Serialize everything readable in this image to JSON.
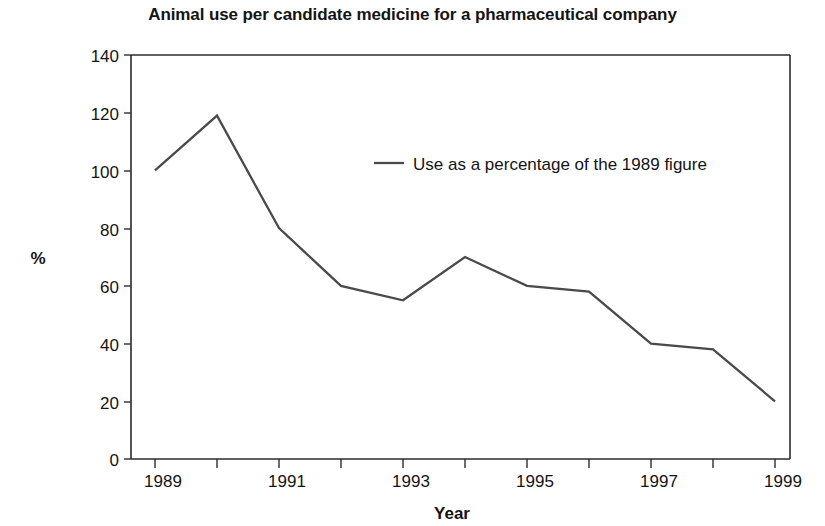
{
  "chart_data": {
    "type": "line",
    "title": "Animal use per candidate medicine for a pharmaceutical company",
    "xlabel": "Year",
    "ylabel": "%",
    "x": [
      1989,
      1990,
      1991,
      1992,
      1993,
      1994,
      1995,
      1996,
      1997,
      1998,
      1999
    ],
    "categories": [
      "1989",
      "1990",
      "1991",
      "1992",
      "1993",
      "1994",
      "1995",
      "1996",
      "1997",
      "1998",
      "1999"
    ],
    "values": [
      100,
      119,
      80,
      60,
      55,
      70,
      60,
      58,
      40,
      38,
      20
    ],
    "series": [
      {
        "name": "Use as a percentage of the 1989 figure",
        "values": [
          100,
          119,
          80,
          60,
          55,
          70,
          60,
          58,
          40,
          38,
          20
        ],
        "color": "#4a4a4a"
      }
    ],
    "xlim": [
      1989,
      1999
    ],
    "ylim": [
      0,
      140
    ],
    "y_ticks": [
      0,
      20,
      40,
      60,
      80,
      100,
      120,
      140
    ],
    "y_tick_labels": [
      "0",
      "20",
      "40",
      "60",
      "80",
      "100",
      "120",
      "140"
    ],
    "x_ticks": [
      1989,
      1990,
      1991,
      1992,
      1993,
      1994,
      1995,
      1996,
      1997,
      1998,
      1999
    ],
    "x_tick_labels": [
      "1989",
      "",
      "1991",
      "",
      "1993",
      "",
      "1995",
      "",
      "1997",
      "",
      "1999"
    ],
    "x_labeled_ticks": [
      "1989",
      "1991",
      "1993",
      "1995",
      "1997",
      "1999"
    ],
    "grid": false,
    "legend": {
      "position": "inside-upper-right",
      "entries": [
        {
          "label": "Use as a percentage of the 1989 figure",
          "color": "#4a4a4a",
          "marker": "line"
        }
      ]
    }
  }
}
